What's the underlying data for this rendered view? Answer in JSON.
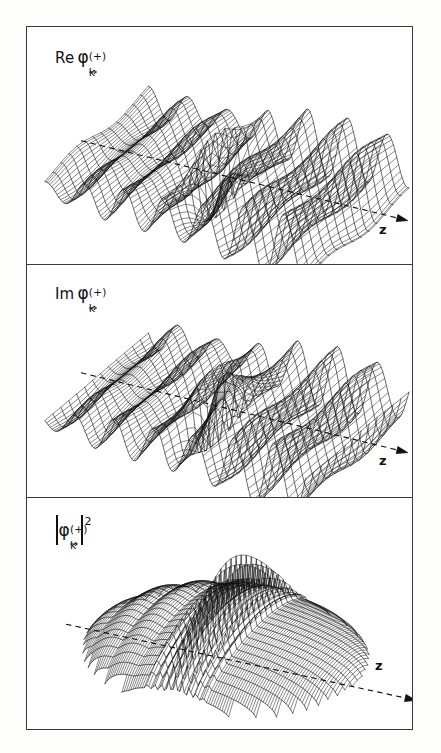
{
  "figure": {
    "panel_count": 3,
    "frame_color": "#3a3a3a",
    "ink_color": "#111111",
    "background": "#ffffff"
  },
  "panels": [
    {
      "id": "re-panel",
      "label": {
        "operator": "Re",
        "symbol": "φ",
        "superscript": "(+)",
        "subscript": "k",
        "subscript_vector": true,
        "absolute_value": false,
        "exponent": ""
      },
      "axis": {
        "name": "z",
        "style": "dashed-arrow"
      },
      "quantity": "real part of scattering wave function"
    },
    {
      "id": "im-panel",
      "label": {
        "operator": "Im",
        "symbol": "φ",
        "superscript": "(+)",
        "subscript": "k",
        "subscript_vector": true,
        "absolute_value": false,
        "exponent": ""
      },
      "axis": {
        "name": "z",
        "style": "dashed-arrow"
      },
      "quantity": "imaginary part of scattering wave function"
    },
    {
      "id": "abs2-panel",
      "label": {
        "operator": "",
        "symbol": "φ",
        "superscript": "(+)",
        "subscript": "k",
        "subscript_vector": true,
        "absolute_value": true,
        "exponent": "2"
      },
      "axis": {
        "name": "z",
        "style": "dashed-arrow"
      },
      "quantity": "squared modulus of scattering wave function"
    }
  ],
  "chart_data": [
    {
      "type": "surface",
      "title": "Re φ_k^(+)",
      "xlabel": "z",
      "ylabel": "",
      "zlabel": "Re φ",
      "projection": "oblique-3d-wireframe",
      "x": [
        -10,
        10
      ],
      "y": [
        -6,
        6
      ],
      "grid": {
        "nx": 78,
        "ny": 19
      },
      "wave_number": 7.0,
      "envelope": "gaussian-ridge",
      "description": "Oscillatory plane-wave-like mesh in z with strong high-frequency distortion near the scattering centre at z=0; amplitude rises toward the far (+z) side.",
      "ylim": [
        -1.4,
        1.4
      ],
      "series": [
        {
          "name": "Re part",
          "formula": "cos(k z + delta(z,y)) * A(z,y)"
        }
      ]
    },
    {
      "type": "surface",
      "title": "Im φ_k^(+)",
      "xlabel": "z",
      "ylabel": "",
      "zlabel": "Im φ",
      "projection": "oblique-3d-wireframe",
      "x": [
        -10,
        10
      ],
      "y": [
        -6,
        6
      ],
      "grid": {
        "nx": 78,
        "ny": 19
      },
      "wave_number": 7.0,
      "envelope": "gaussian-ridge",
      "description": "Same oscillatory mesh phase-shifted by 90 degrees; sharp cusp/node structure at the scattering centre.",
      "ylim": [
        -1.4,
        1.4
      ],
      "series": [
        {
          "name": "Im part",
          "formula": "sin(k z + delta(z,y)) * A(z,y)"
        }
      ]
    },
    {
      "type": "surface",
      "title": "|φ_k^(+)|^2",
      "xlabel": "z",
      "ylabel": "",
      "zlabel": "|φ|^2",
      "projection": "oblique-3d-wireframe",
      "x": [
        -10,
        10
      ],
      "y": [
        -6,
        6
      ],
      "grid": {
        "nx": 46,
        "ny": 17
      },
      "envelope": "smooth-dome",
      "description": "Smooth dome-shaped probability density, flat and regular away from the centre, with a cluster of tall narrow spikes at the scattering centre.",
      "ylim": [
        0,
        1.6
      ],
      "spikes": {
        "count": 9,
        "center": 0,
        "max_height": 1.55
      },
      "series": [
        {
          "name": "density",
          "formula": "|phi|^2"
        }
      ]
    }
  ]
}
